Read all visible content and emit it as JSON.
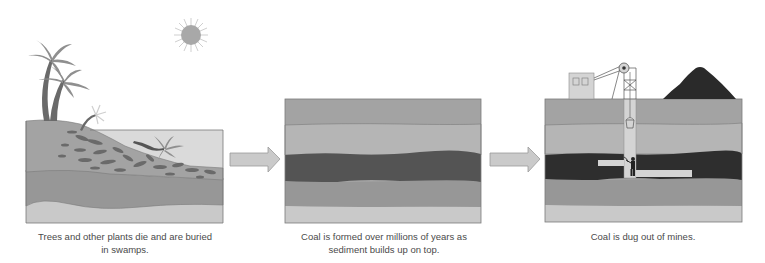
{
  "diagram": {
    "type": "process-flow",
    "topic": "Coal formation",
    "steps": [
      {
        "index": 1,
        "caption_line1": "Trees and other plants die and are buried",
        "caption_line2": "in swamps.",
        "elements": [
          "palm trees",
          "sun",
          "swamp water",
          "fallen trees",
          "buried plant matter",
          "sediment layers"
        ]
      },
      {
        "index": 2,
        "caption_line1": "Coal is formed over millions of years as",
        "caption_line2": "sediment builds up on top.",
        "elements": [
          "sediment layers",
          "coal seam"
        ]
      },
      {
        "index": 3,
        "caption_line1": "Coal is dug out of mines.",
        "caption_line2": "",
        "elements": [
          "mine building",
          "headframe with pulley",
          "coal pile",
          "mine shaft",
          "bucket",
          "tunnels",
          "miner with pickaxe",
          "coal seam"
        ]
      }
    ],
    "connectors": [
      {
        "from": 1,
        "to": 2,
        "shape": "arrow-right"
      },
      {
        "from": 2,
        "to": 3,
        "shape": "arrow-right"
      }
    ],
    "colors": {
      "layer_top": "#a3a3a3",
      "layer_light": "#b5b5b5",
      "coal": "#545454",
      "coal_deep": "#2e2e2e",
      "layer_mid": "#979797",
      "layer_base": "#c9c9c9",
      "water": "#d9d9d9",
      "arrow": "#c8c8c8",
      "sun": "#a8a8a8",
      "outline": "#6e6e6e"
    }
  }
}
